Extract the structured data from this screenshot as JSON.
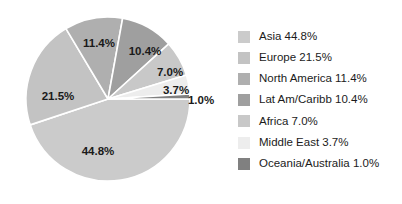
{
  "chart_data": {
    "type": "pie",
    "title": "",
    "xlabel": "",
    "ylabel": "",
    "legend_position": "right",
    "grid": false,
    "start_angle_deg": 0,
    "direction": "clockwise",
    "categories": [
      "Asia",
      "Europe",
      "North America",
      "Lat Am/Caribb",
      "Africa",
      "Middle East",
      "Oceania/Australia"
    ],
    "values": [
      44.8,
      21.5,
      11.4,
      10.4,
      7.0,
      3.7,
      1.0
    ],
    "value_labels": [
      "44.8%",
      "21.5%",
      "11.4%",
      "10.4%",
      "7.0%",
      "3.7%",
      "1.0%"
    ],
    "colors": [
      "#cbcbcb",
      "#c3c3c3",
      "#afafaf",
      "#9f9f9f",
      "#c8c8c8",
      "#ededed",
      "#808080"
    ],
    "slices": [
      {
        "name": "Asia",
        "value": 44.8,
        "label": "44.8%",
        "color": "#cbcbcb",
        "label_inside": true,
        "label_x": 98,
        "label_y": 152
      },
      {
        "name": "Europe",
        "value": 21.5,
        "label": "21.5%",
        "color": "#c3c3c3",
        "label_inside": true,
        "label_x": 58,
        "label_y": 97
      },
      {
        "name": "North America",
        "value": 11.4,
        "label": "11.4%",
        "color": "#afafaf",
        "label_inside": true,
        "label_x": 99,
        "label_y": 44
      },
      {
        "name": "Lat Am/Caribb",
        "value": 10.4,
        "label": "10.4%",
        "color": "#9f9f9f",
        "label_inside": true,
        "label_x": 145,
        "label_y": 52
      },
      {
        "name": "Africa",
        "value": 7.0,
        "label": "7.0%",
        "color": "#c8c8c8",
        "label_inside": true,
        "label_x": 170,
        "label_y": 73
      },
      {
        "name": "Middle East",
        "value": 3.7,
        "label": "3.7%",
        "color": "#ededed",
        "label_inside": true,
        "label_x": 176,
        "label_y": 91
      },
      {
        "name": "Oceania/Australia",
        "value": 1.0,
        "label": "1.0%",
        "color": "#808080",
        "label_inside": false,
        "label_x": 201,
        "label_y": 101
      }
    ]
  },
  "legend": {
    "items": [
      {
        "label": "Asia 44.8%",
        "color": "#cbcbcb"
      },
      {
        "label": "Europe 21.5%",
        "color": "#c3c3c3"
      },
      {
        "label": "North America 11.4%",
        "color": "#afafaf"
      },
      {
        "label": "Lat Am/Caribb 10.4%",
        "color": "#9f9f9f"
      },
      {
        "label": "Africa 7.0%",
        "color": "#c8c8c8"
      },
      {
        "label": "Middle East 3.7%",
        "color": "#ededed"
      },
      {
        "label": "Oceania/Australia 1.0%",
        "color": "#808080"
      }
    ]
  },
  "geometry": {
    "center_x": 108,
    "center_y": 99,
    "radius": 82,
    "separator_color": "#ffffff",
    "separator_width": 1.6
  }
}
